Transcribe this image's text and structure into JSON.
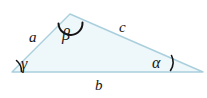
{
  "figure": {
    "type": "triangle-diagram",
    "background_color": "#ffffff",
    "fill_color": "#eef7fa",
    "stroke_color": "#a9cfdd",
    "ink_color": "#141414",
    "vertices": {
      "left": {
        "x": 12,
        "y": 72
      },
      "apex": {
        "x": 70,
        "y": 14
      },
      "right": {
        "x": 203,
        "y": 72
      }
    },
    "sides": [
      {
        "name": "side-a",
        "label": "a",
        "between": [
          "left",
          "apex"
        ]
      },
      {
        "name": "side-b",
        "label": "b",
        "between": [
          "left",
          "right"
        ]
      },
      {
        "name": "side-c",
        "label": "c",
        "between": [
          "apex",
          "right"
        ]
      }
    ],
    "angles": [
      {
        "name": "angle-alpha",
        "label": "α",
        "at": "right",
        "mark": "arc"
      },
      {
        "name": "angle-beta",
        "label": "β",
        "at": "apex",
        "mark": "arc"
      },
      {
        "name": "angle-gamma",
        "label": "γ",
        "at": "left",
        "mark": "arc"
      }
    ]
  }
}
